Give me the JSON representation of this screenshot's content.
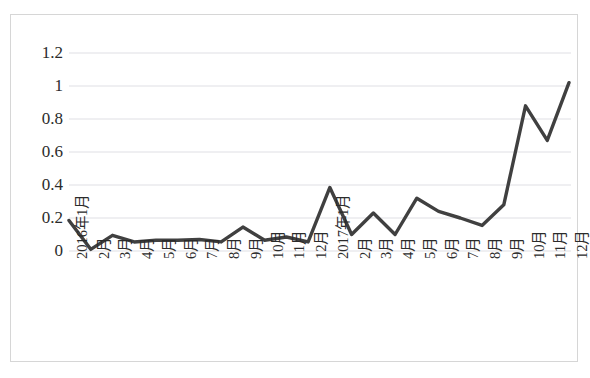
{
  "chart_data": {
    "type": "line",
    "title": "",
    "subtitle": "",
    "xlabel": "",
    "ylabel": "",
    "grid": true,
    "legend": false,
    "legend_position": "none",
    "series_color": "#404040",
    "ylim": [
      0,
      1.2
    ],
    "ytick_labels": [
      "1.2",
      "1",
      "0.8",
      "0.6",
      "0.4",
      "0.2",
      "0"
    ],
    "ytick_values": [
      1.2,
      1.0,
      0.8,
      0.6,
      0.4,
      0.2,
      0
    ],
    "categories": [
      "2016年1月",
      "2月",
      "3月",
      "4月",
      "5月",
      "6月",
      "7月",
      "8月",
      "9月",
      "10月",
      "11月",
      "12月",
      "2017年1月",
      "2月",
      "3月",
      "4月",
      "5月",
      "6月",
      "7月",
      "8月",
      "9月",
      "10月",
      "11月",
      "12月"
    ],
    "series": [
      {
        "name": "series-1",
        "values": [
          0.185,
          0.01,
          0.095,
          0.055,
          0.065,
          0.065,
          0.07,
          0.055,
          0.145,
          0.065,
          0.085,
          0.055,
          0.385,
          0.1,
          0.23,
          0.1,
          0.32,
          0.24,
          0.2,
          0.155,
          0.28,
          0.88,
          0.67,
          1.02
        ]
      }
    ]
  }
}
